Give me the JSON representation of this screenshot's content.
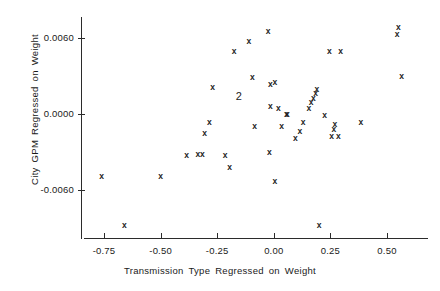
{
  "chart_data": {
    "type": "scatter",
    "title": "",
    "xlabel": "Transmission Type Regressed on Weight",
    "ylabel": "City GPM Regressed on Weight",
    "xlim": [
      -0.85,
      0.68
    ],
    "ylim": [
      -0.0104,
      0.0081
    ],
    "xticks": [
      -0.75,
      -0.5,
      -0.25,
      0.0,
      0.25,
      0.5
    ],
    "xticklabels": [
      "-0.75",
      "-0.50",
      "-0.25",
      "0.00",
      "0.25",
      "0.50"
    ],
    "yticks": [
      0.006,
      0.0,
      -0.006
    ],
    "yticklabels": [
      "0.0060",
      "0.0000",
      "-0.0060"
    ],
    "grid": false,
    "legend": null,
    "marker": "x",
    "overplot_label": "2",
    "overplot_note": "Numeral 2 marks two coincident observations",
    "points": [
      {
        "x": -0.76,
        "y": -0.0049,
        "label": "x"
      },
      {
        "x": -0.66,
        "y": -0.0088,
        "label": "x"
      },
      {
        "x": -0.5,
        "y": -0.0049,
        "label": "x"
      },
      {
        "x": -0.385,
        "y": -0.0033,
        "label": "x"
      },
      {
        "x": -0.335,
        "y": -0.0032,
        "label": "x"
      },
      {
        "x": -0.315,
        "y": -0.0032,
        "label": "x"
      },
      {
        "x": -0.305,
        "y": -0.0015,
        "label": "x"
      },
      {
        "x": -0.285,
        "y": -0.0007,
        "label": "x"
      },
      {
        "x": -0.27,
        "y": 0.0021,
        "label": "x"
      },
      {
        "x": -0.215,
        "y": -0.0033,
        "label": "x"
      },
      {
        "x": -0.195,
        "y": -0.0042,
        "label": "x"
      },
      {
        "x": -0.175,
        "y": 0.0049,
        "label": "x"
      },
      {
        "x": -0.155,
        "y": 0.0014,
        "label": "2",
        "count": 2
      },
      {
        "x": -0.11,
        "y": 0.0057,
        "label": "x"
      },
      {
        "x": -0.095,
        "y": 0.0029,
        "label": "x"
      },
      {
        "x": -0.085,
        "y": -0.001,
        "label": "x"
      },
      {
        "x": -0.025,
        "y": 0.0065,
        "label": "x"
      },
      {
        "x": -0.02,
        "y": -0.003,
        "label": "x"
      },
      {
        "x": -0.015,
        "y": 0.0023,
        "label": "x"
      },
      {
        "x": -0.015,
        "y": 0.0006,
        "label": "x"
      },
      {
        "x": 0.005,
        "y": 0.0025,
        "label": "x"
      },
      {
        "x": 0.005,
        "y": -0.0053,
        "label": "x"
      },
      {
        "x": 0.02,
        "y": 0.0004,
        "label": "x"
      },
      {
        "x": 0.035,
        "y": -0.001,
        "label": "x"
      },
      {
        "x": 0.055,
        "y": -0.0,
        "label": "x"
      },
      {
        "x": 0.06,
        "y": -0.0,
        "label": "x"
      },
      {
        "x": 0.095,
        "y": -0.0019,
        "label": "x"
      },
      {
        "x": 0.115,
        "y": -0.0014,
        "label": "x"
      },
      {
        "x": 0.13,
        "y": -0.0007,
        "label": "x"
      },
      {
        "x": 0.155,
        "y": 0.0004,
        "label": "x"
      },
      {
        "x": 0.165,
        "y": 0.0009,
        "label": "x"
      },
      {
        "x": 0.175,
        "y": 0.0012,
        "label": "x"
      },
      {
        "x": 0.185,
        "y": 0.0016,
        "label": "x"
      },
      {
        "x": 0.19,
        "y": 0.0019,
        "label": "x"
      },
      {
        "x": 0.2,
        "y": -0.0088,
        "label": "x"
      },
      {
        "x": 0.225,
        "y": -0.0001,
        "label": "x"
      },
      {
        "x": 0.245,
        "y": 0.0049,
        "label": "x"
      },
      {
        "x": 0.255,
        "y": -0.0018,
        "label": "x"
      },
      {
        "x": 0.265,
        "y": -0.0012,
        "label": "x"
      },
      {
        "x": 0.27,
        "y": -0.0008,
        "label": "x"
      },
      {
        "x": 0.285,
        "y": -0.0018,
        "label": "x"
      },
      {
        "x": 0.295,
        "y": 0.0049,
        "label": "x"
      },
      {
        "x": 0.385,
        "y": -0.0007,
        "label": "x"
      },
      {
        "x": 0.545,
        "y": 0.0063,
        "label": "x"
      },
      {
        "x": 0.55,
        "y": 0.0068,
        "label": "x"
      },
      {
        "x": 0.565,
        "y": 0.003,
        "label": "x"
      }
    ]
  }
}
